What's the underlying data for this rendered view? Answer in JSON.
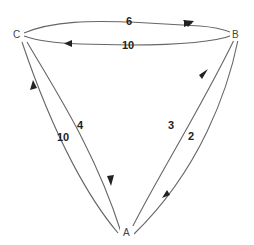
{
  "graph": {
    "type": "directed-weighted",
    "nodes": [
      {
        "id": "A",
        "label": "A"
      },
      {
        "id": "B",
        "label": "B"
      },
      {
        "id": "C",
        "label": "C"
      }
    ],
    "edges": [
      {
        "from": "C",
        "to": "B",
        "weight": "6"
      },
      {
        "from": "B",
        "to": "C",
        "weight": "10"
      },
      {
        "from": "A",
        "to": "C",
        "weight": "10"
      },
      {
        "from": "C",
        "to": "A",
        "weight": "4"
      },
      {
        "from": "A",
        "to": "B",
        "weight": "3"
      },
      {
        "from": "B",
        "to": "A",
        "weight": "2"
      }
    ]
  }
}
